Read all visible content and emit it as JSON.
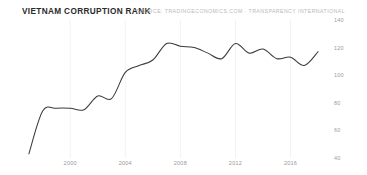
{
  "header": {
    "title": "VIETNAM CORRUPTION RANK",
    "source": "SOURCE: TRADINGECONOMICS.COM  ·  TRANSPARENCY INTERNATIONAL"
  },
  "colors": {
    "background": "#ffffff",
    "line": "#3a3a3a",
    "grid": "#f2f2f2",
    "title_text": "#2b2b2b",
    "axis_text": "#9a9a9a",
    "source_text": "#b9b9b9"
  },
  "chart_data": {
    "type": "line",
    "title": "VIETNAM CORRUPTION RANK",
    "subtitle": "",
    "xlabel": "",
    "ylabel": "",
    "xlim": [
      1996.5,
      2018.5
    ],
    "ylim": [
      40,
      140
    ],
    "grid": "vertical-only",
    "legend": "none",
    "y_ticks": [
      140,
      120,
      100,
      80,
      60,
      40
    ],
    "x_ticks": [
      2000,
      2004,
      2008,
      2012,
      2016
    ],
    "annotations": [
      "SOURCE: TRADINGECONOMICS.COM  ·  TRANSPARENCY INTERNATIONAL"
    ],
    "series": [
      {
        "name": "Vietnam Corruption Rank",
        "x": [
          1997,
          1998,
          1999,
          2000,
          2001,
          2002,
          2003,
          2004,
          2005,
          2006,
          2007,
          2008,
          2009,
          2010,
          2011,
          2012,
          2013,
          2014,
          2015,
          2016,
          2017,
          2018
        ],
        "values": [
          43,
          74,
          76,
          76,
          75,
          85,
          83,
          102,
          107,
          111,
          123,
          121,
          120,
          116,
          112,
          123,
          116,
          119,
          112,
          113,
          107,
          117
        ]
      }
    ]
  }
}
